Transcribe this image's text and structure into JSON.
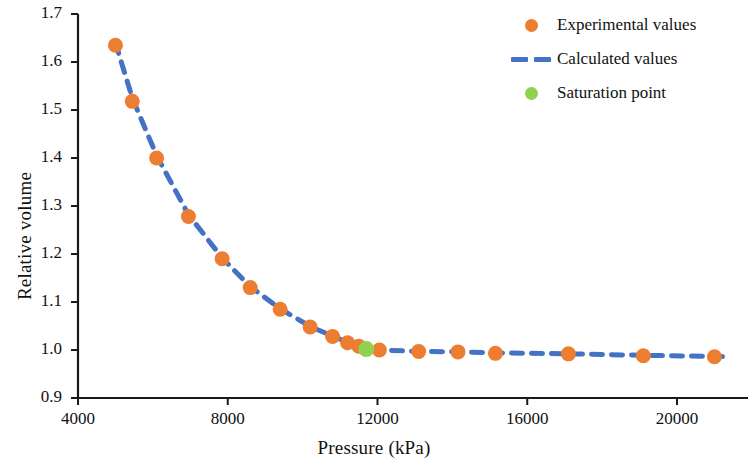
{
  "chart_data": {
    "type": "scatter",
    "title": "",
    "xlabel": "Pressure (kPa)",
    "ylabel": "Relative volume",
    "xlim": [
      4000,
      21800
    ],
    "ylim": [
      0.9,
      1.7
    ],
    "xticks": [
      "4000",
      "8000",
      "12000",
      "16000",
      "20000"
    ],
    "xtick_values": [
      4000,
      8000,
      12000,
      16000,
      20000
    ],
    "yticks": [
      "0.9",
      "1.0",
      "1.1",
      "1.2",
      "1.3",
      "1.4",
      "1.5",
      "1.6",
      "1.7"
    ],
    "ytick_values": [
      0.9,
      1.0,
      1.1,
      1.2,
      1.3,
      1.4,
      1.5,
      1.6,
      1.7
    ],
    "grid": false,
    "legend_position": "top-right",
    "colors": {
      "experimental": "#ED7D31",
      "calculated": "#4472C4",
      "saturation": "#92D050",
      "axis": "#1a1a1a"
    },
    "series": [
      {
        "name": "Experimental values",
        "marker": "circle",
        "color": "#ED7D31",
        "x": [
          5000,
          5450,
          6100,
          6950,
          7850,
          8600,
          9400,
          10200,
          10800,
          11200,
          11500,
          12050,
          13100,
          14150,
          15150,
          17100,
          19100,
          21000
        ],
        "y": [
          1.635,
          1.518,
          1.4,
          1.278,
          1.19,
          1.13,
          1.085,
          1.048,
          1.028,
          1.015,
          1.008,
          1.0,
          0.997,
          0.996,
          0.993,
          0.992,
          0.988,
          0.986
        ]
      },
      {
        "name": "Calculated values",
        "marker": "dashed-line",
        "color": "#4472C4",
        "x": [
          5000,
          5450,
          6100,
          6950,
          7850,
          8600,
          9400,
          10200,
          10800,
          11200,
          11500,
          12050,
          13100,
          14150,
          15150,
          17100,
          19100,
          21400
        ],
        "y": [
          1.64,
          1.525,
          1.405,
          1.282,
          1.192,
          1.132,
          1.086,
          1.049,
          1.029,
          1.016,
          1.008,
          1.0,
          0.997,
          0.996,
          0.994,
          0.992,
          0.989,
          0.986
        ]
      },
      {
        "name": "Saturation point",
        "marker": "circle",
        "color": "#92D050",
        "x": [
          11700
        ],
        "y": [
          1.002
        ]
      }
    ]
  },
  "legend": {
    "items": [
      {
        "label": "Experimental values",
        "key": "dot",
        "color": "#ED7D31"
      },
      {
        "label": "Calculated values",
        "key": "dash",
        "color": "#4472C4"
      },
      {
        "label": "Saturation point",
        "key": "dot",
        "color": "#92D050"
      }
    ]
  }
}
